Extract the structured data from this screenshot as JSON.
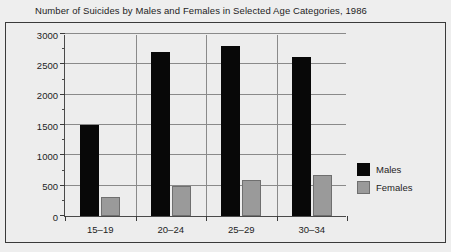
{
  "chart_data": {
    "type": "bar",
    "title": "Number of Suicides by Males and Females in Selected Age Categories, 1986",
    "xlabel": "",
    "ylabel": "",
    "categories": [
      "15–19",
      "20–24",
      "25–29",
      "30–34"
    ],
    "series": [
      {
        "name": "Males",
        "color": "#080808",
        "values": [
          1500,
          2700,
          2800,
          2620
        ]
      },
      {
        "name": "Females",
        "color": "#9a9a9a",
        "values": [
          310,
          500,
          600,
          680
        ]
      }
    ],
    "ylim": [
      0,
      3000
    ],
    "ytick_labels": [
      "0",
      "500",
      "1000",
      "1500",
      "2000",
      "2500",
      "3000"
    ],
    "ytick_values": [
      0,
      500,
      1000,
      1500,
      2000,
      2500,
      3000
    ],
    "yminor_step": 250,
    "grid": "horizontal-and-category-separators",
    "legend_position": "right"
  },
  "legend": {
    "entries": [
      {
        "label": "Males"
      },
      {
        "label": "Females"
      }
    ]
  }
}
